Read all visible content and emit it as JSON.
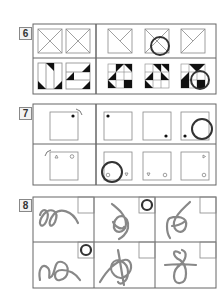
{
  "problems": [
    {
      "number": "6",
      "description": "Squares with diagonal lines; squares with black triangles",
      "answer_marked_top": 2,
      "answer_marked_bottom": 3
    },
    {
      "number": "7",
      "description": "Square with dot rotating; square with triangle and circle rotating",
      "answer_marked_top": 3,
      "answer_marked_bottom": 1
    },
    {
      "number": "8",
      "description": "Looped rope figures — which form a knot",
      "answer_marked": [
        2,
        4
      ]
    }
  ],
  "colors": {
    "line": "#666666",
    "mark": "#333333",
    "rope": "#888888",
    "fill": "#111111"
  }
}
